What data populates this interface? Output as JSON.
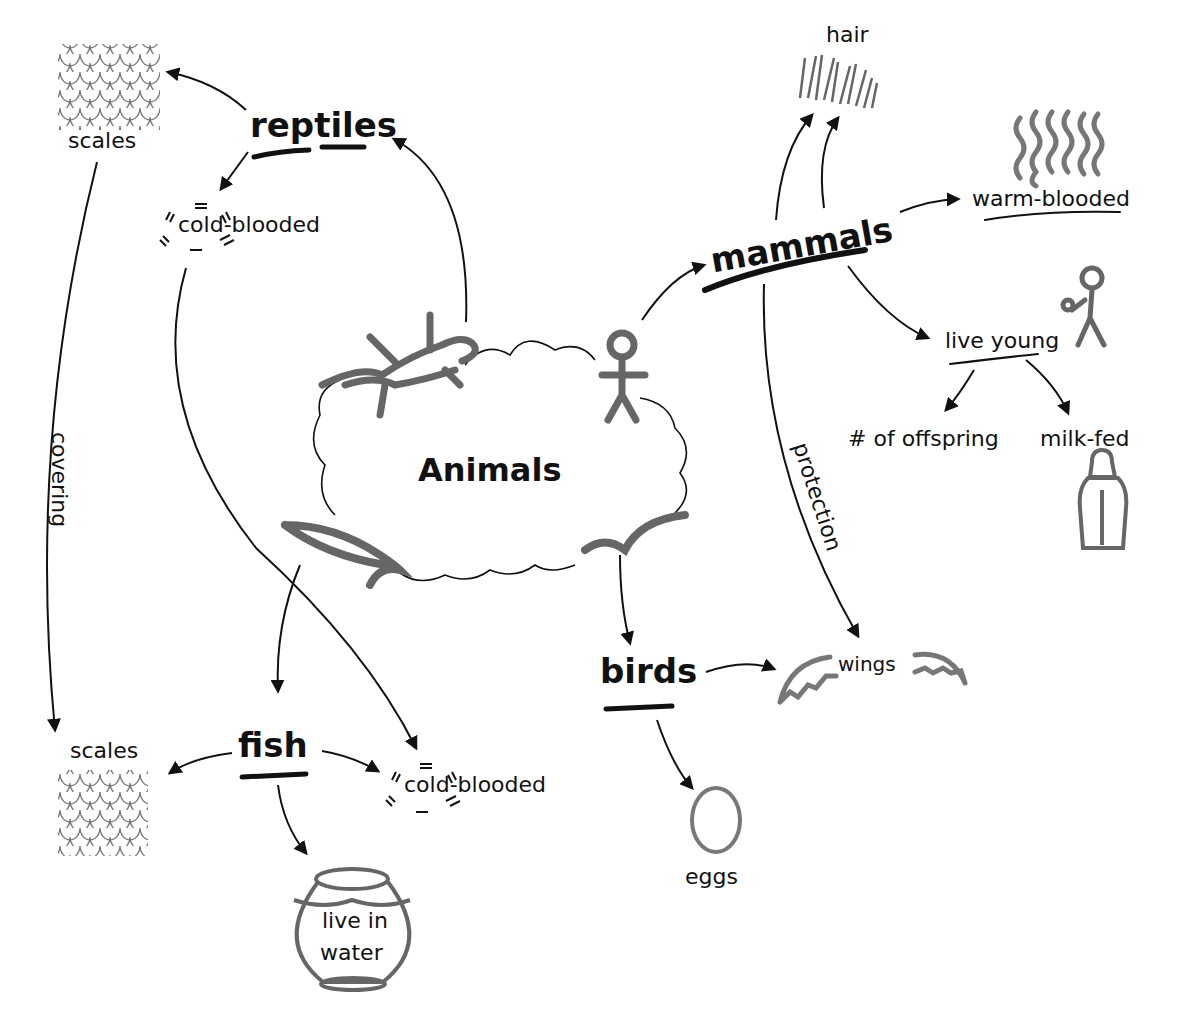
{
  "diagram": {
    "type": "concept-map",
    "title": "Animals",
    "colors": {
      "ink": "#111111",
      "sketch": "#6b6b6b",
      "background": "#ffffff"
    },
    "center": {
      "label": "Animals",
      "icons": [
        "lizard-icon",
        "stick-figure-icon",
        "fish-icon",
        "bird-icon"
      ]
    },
    "categories": {
      "reptiles": {
        "label": "reptiles",
        "traits": {
          "scales": "scales",
          "cold_blooded": "cold-blooded"
        }
      },
      "mammals": {
        "label": "mammals",
        "traits": {
          "hair": "hair",
          "warm_blooded": "warm-blooded",
          "live_young": "live young",
          "offspring": "# of offspring",
          "milk_fed": "milk-fed"
        }
      },
      "fish": {
        "label": "fish",
        "traits": {
          "scales": "scales",
          "cold_blooded": "cold-blooded",
          "water": [
            "live in",
            "water"
          ]
        }
      },
      "birds": {
        "label": "birds",
        "traits": {
          "wings": "wings",
          "eggs": "eggs"
        }
      }
    },
    "edge_labels": {
      "covering": "covering",
      "protection": "protection"
    },
    "edges": [
      {
        "from": "Animals",
        "to": "reptiles"
      },
      {
        "from": "Animals",
        "to": "mammals"
      },
      {
        "from": "Animals",
        "to": "fish"
      },
      {
        "from": "Animals",
        "to": "birds"
      },
      {
        "from": "reptiles",
        "to": "scales"
      },
      {
        "from": "reptiles",
        "to": "cold-blooded"
      },
      {
        "from": "reptiles.scales",
        "to": "fish.scales",
        "label": "covering"
      },
      {
        "from": "reptiles.cold-blooded",
        "to": "fish.cold-blooded"
      },
      {
        "from": "mammals",
        "to": "hair"
      },
      {
        "from": "mammals",
        "to": "warm-blooded"
      },
      {
        "from": "mammals",
        "to": "live young"
      },
      {
        "from": "live young",
        "to": "# of offspring"
      },
      {
        "from": "live young",
        "to": "milk-fed"
      },
      {
        "from": "mammals",
        "to": "wings",
        "label": "protection"
      },
      {
        "from": "fish",
        "to": "scales"
      },
      {
        "from": "fish",
        "to": "cold-blooded"
      },
      {
        "from": "fish",
        "to": "live in water"
      },
      {
        "from": "birds",
        "to": "wings"
      },
      {
        "from": "birds",
        "to": "eggs"
      }
    ]
  }
}
